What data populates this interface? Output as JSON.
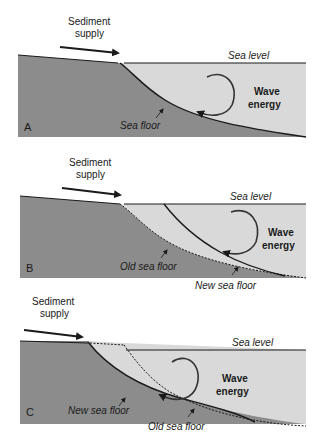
{
  "figure": {
    "colors": {
      "land": "#8c8c8c",
      "water": "#d9d9d9",
      "line": "#1a1a1a"
    },
    "panels": [
      {
        "id": "A",
        "letter": "A",
        "sediment_label": [
          "Sediment",
          "supply"
        ],
        "sea_level_label": "Sea level",
        "wave_label": [
          "Wave",
          "energy"
        ],
        "floor_labels": [
          "Sea floor"
        ]
      },
      {
        "id": "B",
        "letter": "B",
        "sediment_label": [
          "Sediment",
          "supply"
        ],
        "sea_level_label": "Sea level",
        "wave_label": [
          "Wave",
          "energy"
        ],
        "floor_labels": [
          "Old sea floor",
          "New sea floor"
        ]
      },
      {
        "id": "C",
        "letter": "C",
        "sediment_label": [
          "Sediment",
          "supply"
        ],
        "sea_level_label": "Sea level",
        "wave_label": [
          "Wave",
          "energy"
        ],
        "floor_labels": [
          "New sea floor",
          "Old sea floor"
        ]
      }
    ]
  }
}
